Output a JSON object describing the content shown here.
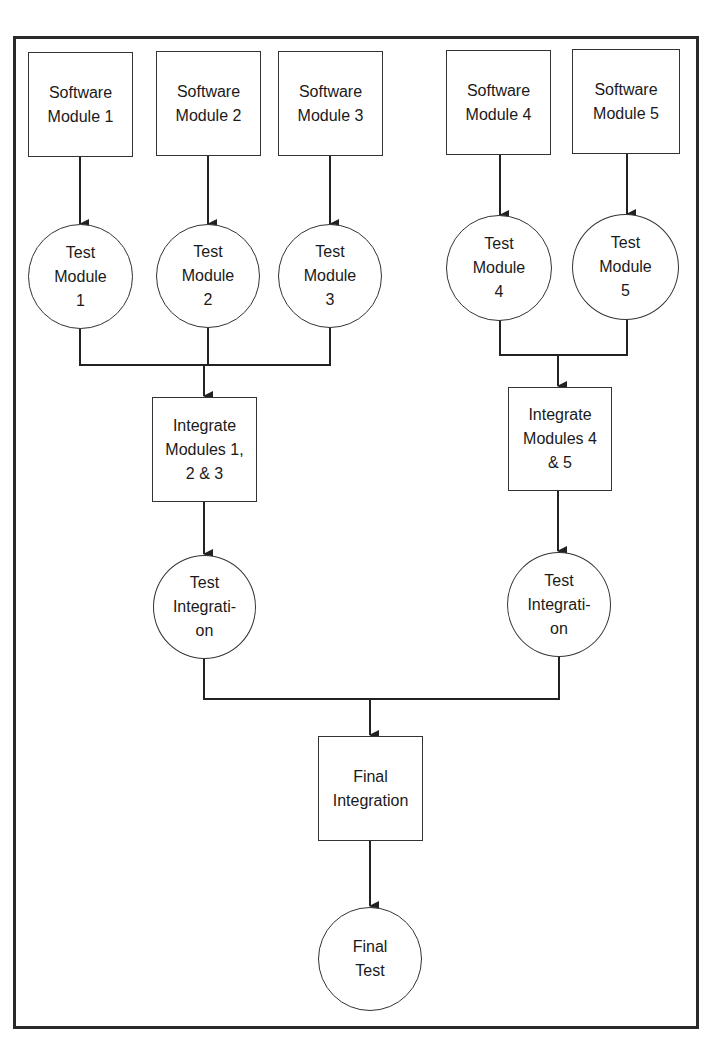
{
  "diagram": {
    "type": "flowchart",
    "nodes": [
      {
        "id": "sm1",
        "shape": "rect",
        "label": "Software\nModule 1"
      },
      {
        "id": "sm2",
        "shape": "rect",
        "label": "Software\nModule 2"
      },
      {
        "id": "sm3",
        "shape": "rect",
        "label": "Software\nModule 3"
      },
      {
        "id": "sm4",
        "shape": "rect",
        "label": "Software\nModule 4"
      },
      {
        "id": "sm5",
        "shape": "rect",
        "label": "Software\nModule 5"
      },
      {
        "id": "tm1",
        "shape": "circle",
        "label": "Test\nModule\n1"
      },
      {
        "id": "tm2",
        "shape": "circle",
        "label": "Test\nModule\n2"
      },
      {
        "id": "tm3",
        "shape": "circle",
        "label": "Test\nModule\n3"
      },
      {
        "id": "tm4",
        "shape": "circle",
        "label": "Test\nModule\n4"
      },
      {
        "id": "tm5",
        "shape": "circle",
        "label": "Test\nModule\n5"
      },
      {
        "id": "int123",
        "shape": "rect",
        "label": "Integrate\nModules 1,\n2 & 3"
      },
      {
        "id": "int45",
        "shape": "rect",
        "label": "Integrate\nModules 4\n& 5"
      },
      {
        "id": "ti1",
        "shape": "circle",
        "label": "Test\nIntegrati-\non"
      },
      {
        "id": "ti2",
        "shape": "circle",
        "label": "Test\nIntegrati-\non"
      },
      {
        "id": "fi",
        "shape": "rect",
        "label": "Final\nIntegration"
      },
      {
        "id": "ft",
        "shape": "circle",
        "label": "Final\nTest"
      }
    ],
    "edges": [
      [
        "sm1",
        "tm1"
      ],
      [
        "sm2",
        "tm2"
      ],
      [
        "sm3",
        "tm3"
      ],
      [
        "sm4",
        "tm4"
      ],
      [
        "sm5",
        "tm5"
      ],
      [
        "tm1",
        "int123"
      ],
      [
        "tm2",
        "int123"
      ],
      [
        "tm3",
        "int123"
      ],
      [
        "tm4",
        "int45"
      ],
      [
        "tm5",
        "int45"
      ],
      [
        "int123",
        "ti1"
      ],
      [
        "int45",
        "ti2"
      ],
      [
        "ti1",
        "fi"
      ],
      [
        "ti2",
        "fi"
      ],
      [
        "fi",
        "ft"
      ]
    ]
  }
}
